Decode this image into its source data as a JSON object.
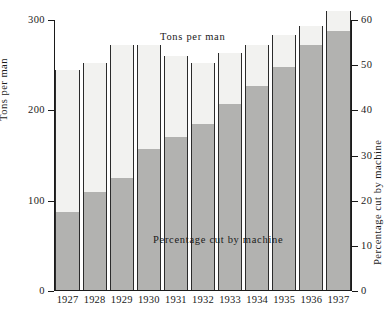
{
  "chart_data": {
    "type": "bar",
    "title": "",
    "subtitle": "",
    "categories": [
      "1927",
      "1928",
      "1929",
      "1930",
      "1931",
      "1932",
      "1933",
      "1934",
      "1935",
      "1936",
      "1937"
    ],
    "xlabel": "",
    "ylabel": "Tons per man",
    "ylabel_right": "Percentage cut by machine",
    "ylim": [
      0,
      300
    ],
    "ylim_right": [
      0,
      60
    ],
    "yticks": [
      0,
      100,
      200,
      300
    ],
    "yticks_right": [
      0,
      10,
      20,
      30,
      40,
      50,
      60
    ],
    "grid": false,
    "legend_position": "inline-annotations",
    "series": [
      {
        "name": "Tons per man",
        "axis": "left",
        "units": "tons",
        "values": [
          245,
          252,
          272,
          272,
          260,
          252,
          263,
          272,
          283,
          293,
          310
        ]
      },
      {
        "name": "Percentage cut by machine",
        "axis": "right",
        "units": "percent",
        "values": [
          17.5,
          22.0,
          25.0,
          31.5,
          34.0,
          37.0,
          41.5,
          45.5,
          49.5,
          54.5,
          57.5
        ]
      }
    ],
    "annotations": [
      {
        "id": "tons-per-man",
        "text": "Tons per man"
      },
      {
        "id": "percentage-cut-by-machine",
        "text": "Percentage cut by machine"
      }
    ],
    "colors": {
      "bar_total_fill": "#f2f2f0",
      "bar_pct_fill": "#b2b2b0",
      "axis": "#1a1a1a",
      "bar_edge": "#2b2b2b",
      "background": "#ffffff"
    }
  },
  "axes": {
    "left": {
      "title": "Tons per man",
      "tick_labels": [
        "0",
        "100",
        "200",
        "300"
      ]
    },
    "right": {
      "title": "Percentage cut by machine",
      "tick_labels": [
        "0",
        "10",
        "20",
        "30",
        "40",
        "50",
        "60"
      ]
    },
    "bottom": {
      "tick_labels": [
        "1927",
        "1928",
        "1929",
        "1930",
        "1931",
        "1932",
        "1933",
        "1934",
        "1935",
        "1936",
        "1937"
      ]
    }
  },
  "annotations": {
    "tons_per_man": "Tons per man",
    "percentage_cut_by_machine": "Percentage cut by machine"
  }
}
